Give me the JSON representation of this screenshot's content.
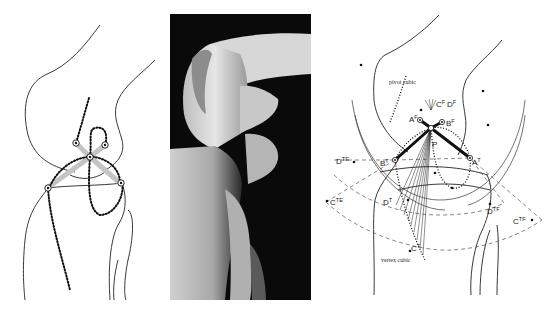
{
  "figure": {
    "panels": [
      {
        "id": "left",
        "description": "Line drawing of knee with cruciate ligament four-bar linkage and dotted loci"
      },
      {
        "id": "photo",
        "description": "Grayscale photograph of dissected knee joint"
      },
      {
        "id": "right",
        "description": "Geometric construction with pivot cubic and vertex cubic"
      }
    ],
    "right_labels": {
      "pivot_cubic": "pivot cubic",
      "vertex_cubic": "vertex cubic",
      "AF": {
        "base": "A",
        "sup": "F"
      },
      "BF": {
        "base": "B",
        "sup": "F"
      },
      "CF": {
        "base": "C",
        "sup": "F"
      },
      "DF": {
        "base": "D",
        "sup": "F"
      },
      "P": {
        "base": "P",
        "sup": ""
      },
      "BT": {
        "base": "B",
        "sup": "T"
      },
      "AT": {
        "base": "A",
        "sup": "T"
      },
      "DT": {
        "base": "D",
        "sup": "T"
      },
      "CT": {
        "base": "C",
        "sup": "T"
      },
      "DTE": {
        "base": "D",
        "sup": "TE"
      },
      "CTE": {
        "base": "C",
        "sup": "TE"
      },
      "DTF": {
        "base": "D",
        "sup": "TF"
      },
      "CTF": {
        "base": "C",
        "sup": "TF"
      }
    },
    "colors": {
      "line": "#222222",
      "ligament_gray": "#bdbdbd",
      "photo_bg": "#0a0a0a"
    }
  }
}
